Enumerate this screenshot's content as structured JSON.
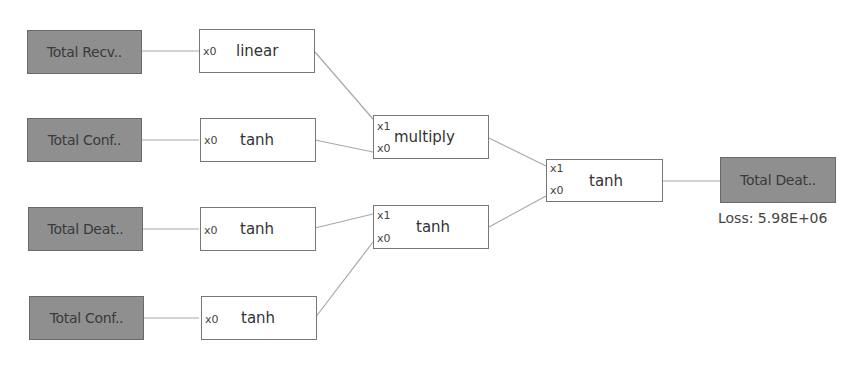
{
  "diagram": {
    "inputs": [
      {
        "id": "in1",
        "label": "Total Recv.."
      },
      {
        "id": "in2",
        "label": "Total Conf.."
      },
      {
        "id": "in3",
        "label": "Total Deat.."
      },
      {
        "id": "in4",
        "label": "Total Conf.."
      }
    ],
    "layer1": [
      {
        "id": "f1",
        "label": "linear",
        "ports": [
          "x0"
        ]
      },
      {
        "id": "f2",
        "label": "tanh",
        "ports": [
          "x0"
        ]
      },
      {
        "id": "f3",
        "label": "tanh",
        "ports": [
          "x0"
        ]
      },
      {
        "id": "f4",
        "label": "tanh",
        "ports": [
          "x0"
        ]
      }
    ],
    "layer2": [
      {
        "id": "g1",
        "label": "multiply",
        "ports": [
          "x1",
          "x0"
        ]
      },
      {
        "id": "g2",
        "label": "tanh",
        "ports": [
          "x1",
          "x0"
        ]
      }
    ],
    "layer3": [
      {
        "id": "h1",
        "label": "tanh",
        "ports": [
          "x1",
          "x0"
        ]
      }
    ],
    "output": {
      "id": "out",
      "label": "Total Deat..",
      "loss": "Loss: 5.98E+06"
    },
    "edges": [
      {
        "from": "in1",
        "to": "f1.x0"
      },
      {
        "from": "in2",
        "to": "f2.x0"
      },
      {
        "from": "in3",
        "to": "f3.x0"
      },
      {
        "from": "in4",
        "to": "f4.x0"
      },
      {
        "from": "f1",
        "to": "g1.x1"
      },
      {
        "from": "f2",
        "to": "g1.x0"
      },
      {
        "from": "f3",
        "to": "g2.x1"
      },
      {
        "from": "f4",
        "to": "g2.x0"
      },
      {
        "from": "g1",
        "to": "h1.x1"
      },
      {
        "from": "g2",
        "to": "h1.x0"
      },
      {
        "from": "h1",
        "to": "out"
      }
    ],
    "colors": {
      "input_fill": "#8f8f8f",
      "edge": "#a8a8a8",
      "box_border": "#777777"
    }
  }
}
